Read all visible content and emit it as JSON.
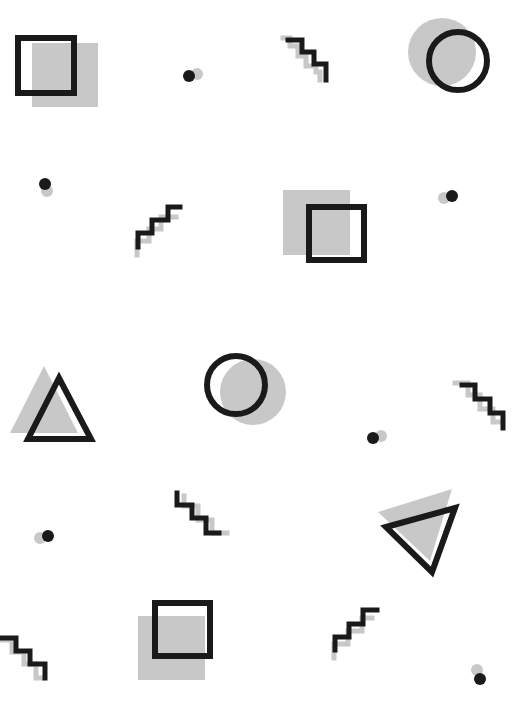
{
  "canvas": {
    "width": 520,
    "height": 708,
    "background": "#ffffff"
  },
  "colors": {
    "ink": "#1a1a1a",
    "shadow": "#c8c8c8"
  },
  "shapes": [
    {
      "type": "square",
      "name": "square-top-left",
      "shadow": {
        "x": 32,
        "y": 43,
        "w": 66,
        "h": 64
      },
      "outline": {
        "x": 15,
        "y": 35,
        "w": 62,
        "h": 61,
        "stroke": 6
      }
    },
    {
      "type": "dot",
      "name": "dot-top-center",
      "shadow": {
        "cx": 197,
        "cy": 74,
        "r": 6
      },
      "main": {
        "cx": 189,
        "cy": 76,
        "r": 6
      }
    },
    {
      "type": "zigzag",
      "name": "zigzag-top-center",
      "shadow": {
        "points": "283,38 290,38 290,46 298,46 298,56 306,56 306,66 316,66 316,72 320,72 320,80",
        "stroke": 5
      },
      "main": {
        "points": "288,40 302,40 302,52 314,52 314,64 326,64 326,80",
        "stroke": 5
      }
    },
    {
      "type": "circle",
      "name": "circle-top-right",
      "shadow": {
        "cx": 442,
        "cy": 52,
        "r": 34
      },
      "outline": {
        "cx": 458,
        "cy": 61,
        "r": 32,
        "stroke": 6
      }
    },
    {
      "type": "dot",
      "name": "dot-row2-left",
      "shadow": {
        "cx": 47,
        "cy": 191,
        "r": 6
      },
      "main": {
        "cx": 45,
        "cy": 184,
        "r": 6
      }
    },
    {
      "type": "zigzag",
      "name": "zigzag-row2-center",
      "shadow": {
        "points": "137,255 137,241 149,241 149,229 161,229 161,217 176,217",
        "stroke": 5
      },
      "main": {
        "points": "138,247 138,233 152,233 152,220 168,220 168,207 180,207",
        "stroke": 5
      }
    },
    {
      "type": "square",
      "name": "square-row2-center",
      "shadow": {
        "x": 283,
        "y": 190,
        "w": 67,
        "h": 65
      },
      "outline": {
        "x": 306,
        "y": 204,
        "w": 61,
        "h": 59,
        "stroke": 6
      }
    },
    {
      "type": "dot",
      "name": "dot-row2-right",
      "shadow": {
        "cx": 444,
        "cy": 198,
        "r": 6
      },
      "main": {
        "cx": 452,
        "cy": 196,
        "r": 6
      }
    },
    {
      "type": "triangle",
      "name": "triangle-row3-left",
      "shadow": {
        "points": "44,366 10,433 78,433"
      },
      "outline": {
        "points": "59,378 28,439 91,439",
        "stroke": 6
      }
    },
    {
      "type": "circle",
      "name": "circle-row3-center",
      "shadow": {
        "cx": 253,
        "cy": 392,
        "r": 33
      },
      "outline": {
        "cx": 236,
        "cy": 385,
        "r": 32,
        "stroke": 6
      }
    },
    {
      "type": "dot",
      "name": "dot-row3-right",
      "shadow": {
        "cx": 381,
        "cy": 436,
        "r": 6
      },
      "main": {
        "cx": 373,
        "cy": 438,
        "r": 6
      }
    },
    {
      "type": "zigzag",
      "name": "zigzag-row3-right",
      "shadow": {
        "points": "455,383 468,383 468,395 480,395 480,409 493,409 493,422 502,422",
        "stroke": 5
      },
      "main": {
        "points": "462,385 475,385 475,399 490,399 490,413 503,413 503,428",
        "stroke": 5
      }
    },
    {
      "type": "dot",
      "name": "dot-row4-left",
      "shadow": {
        "cx": 40,
        "cy": 538,
        "r": 6
      },
      "main": {
        "cx": 48,
        "cy": 536,
        "r": 6
      }
    },
    {
      "type": "zigzag",
      "name": "zigzag-row4-center",
      "shadow": {
        "points": "184,496 184,506 198,506 198,520 212,520 212,533 227,533",
        "stroke": 5
      },
      "main": {
        "points": "177,493 177,505 192,505 192,518 206,518 206,533 219,533",
        "stroke": 5
      }
    },
    {
      "type": "triangle",
      "name": "triangle-row4-right",
      "shadow": {
        "points": "378,512 452,489 430,561"
      },
      "outline": {
        "points": "386,527 455,508 432,572",
        "stroke": 6
      }
    },
    {
      "type": "zigzag",
      "name": "zigzag-bottom-left",
      "shadow": {
        "points": "2,640 12,640 12,652 24,652 24,664 36,664 36,678 42,678",
        "stroke": 5
      },
      "main": {
        "points": "2,638 16,638 16,651 30,651 30,664 45,664 45,678",
        "stroke": 5
      }
    },
    {
      "type": "square",
      "name": "square-bottom-center",
      "shadow": {
        "x": 138,
        "y": 616,
        "w": 67,
        "h": 64
      },
      "outline": {
        "x": 152,
        "y": 600,
        "w": 61,
        "h": 59,
        "stroke": 6
      }
    },
    {
      "type": "zigzag",
      "name": "zigzag-bottom-center",
      "shadow": {
        "points": "334,658 334,644 348,644 348,631 362,631 362,618 372,618",
        "stroke": 5
      },
      "main": {
        "points": "335,650 335,637 349,637 349,624 363,624 363,610 377,610",
        "stroke": 5
      }
    },
    {
      "type": "dot",
      "name": "dot-bottom-right",
      "shadow": {
        "cx": 477,
        "cy": 670,
        "r": 6
      },
      "main": {
        "cx": 480,
        "cy": 679,
        "r": 6
      }
    }
  ]
}
